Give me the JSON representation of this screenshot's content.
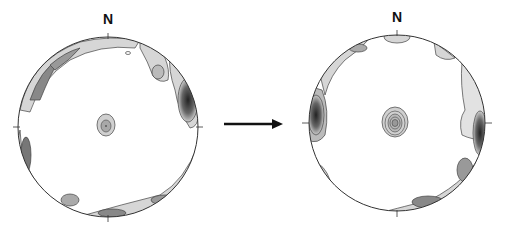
{
  "diagram": {
    "type": "stereonet-comparison",
    "left_net": {
      "north_label": "N",
      "center": [
        108,
        127
      ],
      "radius": 90
    },
    "right_net": {
      "north_label": "N",
      "center": [
        397,
        123
      ],
      "radius": 88
    },
    "arrow": {
      "from": [
        224,
        124
      ],
      "to": [
        283,
        124
      ],
      "meaning": "transformation"
    },
    "colors": {
      "outline": "#333333",
      "fill_light": "#d8d8d8",
      "fill_mid": "#a8a8a8",
      "fill_dark": "#555555",
      "background": "#ffffff"
    }
  }
}
